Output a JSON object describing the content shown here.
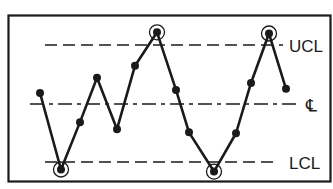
{
  "chart_data": {
    "type": "line",
    "title": "",
    "xlabel": "",
    "ylabel": "",
    "grid": false,
    "legend": "none",
    "ylim": [
      -2.1,
      2.1
    ],
    "limits": {
      "ucl": {
        "label": "UCL",
        "value": 2.0
      },
      "center": {
        "label": "℄",
        "value": 0.0
      },
      "lcl": {
        "label": "LCL",
        "value": -2.0
      }
    },
    "x": [
      1,
      2,
      3,
      4,
      5,
      6,
      7,
      8,
      9,
      10,
      11,
      12,
      13,
      14
    ],
    "values": [
      0.38,
      -2.24,
      -0.62,
      0.9,
      -0.86,
      1.31,
      2.45,
      0.48,
      -0.97,
      -2.31,
      -1.0,
      0.72,
      2.41,
      0.52
    ],
    "series_note": "extreme points",
    "circled_points": [
      2,
      7,
      10,
      13
    ],
    "line_color": "#1a1a1a",
    "background": "#ffffff"
  },
  "labels": {
    "ucl": "UCL",
    "center": "℄",
    "lcl": "LCL"
  }
}
